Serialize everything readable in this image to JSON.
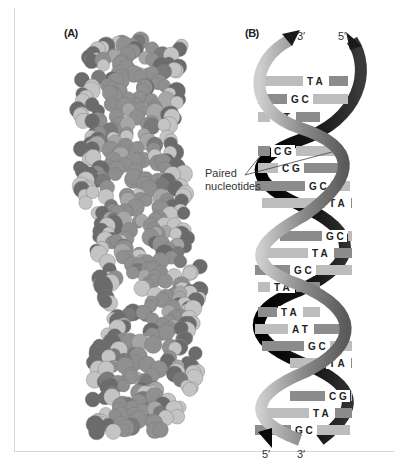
{
  "panels": {
    "a": {
      "label": "(A)",
      "description": "space-filling model of DNA double helix"
    },
    "b": {
      "label": "(B)",
      "description": "ribbon model of DNA double helix"
    }
  },
  "strand_ends": {
    "top_left": "3′",
    "top_right": "5′",
    "bottom_left": "5′",
    "bottom_right": "3′"
  },
  "callout": {
    "line1": "Paired",
    "line2": "nucleotides"
  },
  "base_pairs": [
    {
      "text": "T A",
      "y": 81,
      "x1": 265,
      "x2": 348,
      "tx": 305
    },
    {
      "text": "G C",
      "y": 99,
      "x1": 258,
      "x2": 348,
      "tx": 289
    },
    {
      "text": "A T",
      "y": 117,
      "x1": 258,
      "x2": 320,
      "tx": 272
    },
    {
      "text": "C G",
      "y": 151,
      "x1": 258,
      "x2": 340,
      "tx": 272
    },
    {
      "text": "C G",
      "y": 168,
      "x1": 258,
      "x2": 345,
      "tx": 280
    },
    {
      "text": "G C",
      "y": 186,
      "x1": 255,
      "x2": 350,
      "tx": 307
    },
    {
      "text": "T A",
      "y": 203,
      "x1": 262,
      "x2": 352,
      "tx": 327
    },
    {
      "text": "G C",
      "y": 236,
      "x1": 280,
      "x2": 352,
      "tx": 324
    },
    {
      "text": "T A",
      "y": 253,
      "x1": 262,
      "x2": 352,
      "tx": 310
    },
    {
      "text": "G C",
      "y": 270,
      "x1": 255,
      "x2": 352,
      "tx": 292
    },
    {
      "text": "T A",
      "y": 287,
      "x1": 258,
      "x2": 320,
      "tx": 272
    },
    {
      "text": "T A",
      "y": 312,
      "x1": 258,
      "x2": 320,
      "tx": 279
    },
    {
      "text": "A T",
      "y": 329,
      "x1": 255,
      "x2": 345,
      "tx": 290
    },
    {
      "text": "G C",
      "y": 346,
      "x1": 262,
      "x2": 352,
      "tx": 306
    },
    {
      "text": "T A",
      "y": 363,
      "x1": 290,
      "x2": 352,
      "tx": 327
    },
    {
      "text": "C G",
      "y": 396,
      "x1": 290,
      "x2": 352,
      "tx": 327
    },
    {
      "text": "T A",
      "y": 413,
      "x1": 262,
      "x2": 352,
      "tx": 311
    },
    {
      "text": "G C",
      "y": 430,
      "x1": 255,
      "x2": 350,
      "tx": 293
    }
  ],
  "colors": {
    "strand_dark": "#141414",
    "strand_light": "#9a9a9a",
    "bar_light": "#bdbdbd",
    "bar_mid": "#8c8c8c",
    "atom_dark": "#6b6b6b",
    "atom_mid": "#8e8e8e",
    "atom_light": "#c4c4c4"
  }
}
